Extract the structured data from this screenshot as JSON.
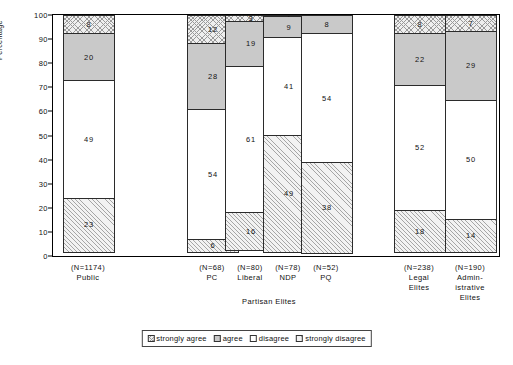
{
  "chart_data": {
    "type": "bar",
    "subtype": "stacked-bar-100",
    "title": "",
    "xlabel": "",
    "ylabel": "Percentage",
    "ylim": [
      0,
      100
    ],
    "yticks": [
      0,
      10,
      20,
      30,
      40,
      50,
      60,
      70,
      80,
      90,
      100
    ],
    "grid": false,
    "legend_position": "bottom",
    "series": [
      {
        "name": "strongly agree",
        "key": "sa",
        "values": [
          8,
          12,
          3,
          1,
          0,
          8,
          7
        ]
      },
      {
        "name": "agree",
        "key": "a",
        "values": [
          20,
          28,
          19,
          9,
          8,
          22,
          29
        ]
      },
      {
        "name": "disagree",
        "key": "d",
        "values": [
          49,
          54,
          61,
          41,
          54,
          52,
          50
        ]
      },
      {
        "name": "strongly disagree",
        "key": "sd",
        "values": [
          23,
          6,
          16,
          49,
          38,
          18,
          14
        ]
      }
    ],
    "categories": [
      "Public",
      "PC",
      "Liberal",
      "NDP",
      "PQ",
      "Legal Elites",
      "Administrative Elites"
    ],
    "sample_sizes": [
      "(N=1174)",
      "(N=68)",
      "(N=80)",
      "(N=78)",
      "(N=52)",
      "(N=238)",
      "(N=190)"
    ],
    "group_label": "Partisan Elites"
  },
  "axis": {
    "y_title": "Percentage",
    "y_ticks": [
      "0",
      "10",
      "20",
      "30",
      "40",
      "50",
      "60",
      "70",
      "80",
      "90",
      "100"
    ]
  },
  "bars": [
    {
      "name": "Public",
      "n_label": "(N=1174)",
      "category_lines": [
        "Public"
      ],
      "segments": [
        {
          "label": "strongly agree",
          "value": 8,
          "display": "8",
          "fill": "sa"
        },
        {
          "label": "agree",
          "value": 20,
          "display": "20",
          "fill": "a"
        },
        {
          "label": "disagree",
          "value": 49,
          "display": "49",
          "fill": "d"
        },
        {
          "label": "strongly disagree",
          "value": 23,
          "display": "23",
          "fill": "sd"
        }
      ]
    },
    {
      "name": "PC",
      "n_label": "(N=68)",
      "category_lines": [
        "PC"
      ],
      "segments": [
        {
          "label": "strongly agree",
          "value": 12,
          "display": "12",
          "fill": "sa"
        },
        {
          "label": "agree",
          "value": 28,
          "display": "28",
          "fill": "a"
        },
        {
          "label": "disagree",
          "value": 54,
          "display": "54",
          "fill": "d"
        },
        {
          "label": "strongly disagree",
          "value": 6,
          "display": "6",
          "fill": "sd"
        }
      ]
    },
    {
      "name": "Liberal",
      "n_label": "(N=80)",
      "category_lines": [
        "Liberal"
      ],
      "segments": [
        {
          "label": "strongly agree",
          "value": 3,
          "display": "3",
          "fill": "sa"
        },
        {
          "label": "agree",
          "value": 19,
          "display": "19",
          "fill": "a"
        },
        {
          "label": "disagree",
          "value": 61,
          "display": "61",
          "fill": "d"
        },
        {
          "label": "strongly disagree",
          "value": 16,
          "display": "16",
          "fill": "sd"
        }
      ]
    },
    {
      "name": "NDP",
      "n_label": "(N=78)",
      "category_lines": [
        "NDP"
      ],
      "segments": [
        {
          "label": "strongly agree",
          "value": 1,
          "display": "1",
          "fill": "sa"
        },
        {
          "label": "agree",
          "value": 9,
          "display": "9",
          "fill": "a"
        },
        {
          "label": "disagree",
          "value": 41,
          "display": "41",
          "fill": "d"
        },
        {
          "label": "strongly disagree",
          "value": 49,
          "display": "49",
          "fill": "sd"
        }
      ]
    },
    {
      "name": "PQ",
      "n_label": "(N=52)",
      "category_lines": [
        "PQ"
      ],
      "segments": [
        {
          "label": "strongly agree",
          "value": 0,
          "display": "",
          "fill": "sa"
        },
        {
          "label": "agree",
          "value": 8,
          "display": "8",
          "fill": "a"
        },
        {
          "label": "disagree",
          "value": 54,
          "display": "54",
          "fill": "d"
        },
        {
          "label": "strongly disagree",
          "value": 38,
          "display": "38",
          "fill": "sd"
        }
      ]
    },
    {
      "name": "Legal Elites",
      "n_label": "(N=238)",
      "category_lines": [
        "Legal",
        "Elites"
      ],
      "segments": [
        {
          "label": "strongly agree",
          "value": 8,
          "display": "8",
          "fill": "sa"
        },
        {
          "label": "agree",
          "value": 22,
          "display": "22",
          "fill": "a"
        },
        {
          "label": "disagree",
          "value": 52,
          "display": "52",
          "fill": "d"
        },
        {
          "label": "strongly disagree",
          "value": 18,
          "display": "18",
          "fill": "sd"
        }
      ]
    },
    {
      "name": "Administrative Elites",
      "n_label": "(N=190)",
      "category_lines": [
        "Admin-",
        "istrative",
        "Elites"
      ],
      "segments": [
        {
          "label": "strongly agree",
          "value": 7,
          "display": "7",
          "fill": "sa"
        },
        {
          "label": "agree",
          "value": 29,
          "display": "29",
          "fill": "a"
        },
        {
          "label": "disagree",
          "value": 50,
          "display": "50",
          "fill": "d"
        },
        {
          "label": "strongly disagree",
          "value": 14,
          "display": "14",
          "fill": "sd"
        }
      ]
    }
  ],
  "group_label": "Partisan Elites",
  "legend": {
    "items": [
      {
        "label": "strongly agree",
        "fill": "sa"
      },
      {
        "label": "agree",
        "fill": "a"
      },
      {
        "label": "disagree",
        "fill": "d"
      },
      {
        "label": "strongly disagree",
        "fill": "sd"
      }
    ]
  },
  "colors": {
    "agree_grey": "#c9c9c9",
    "hatch_grey": "#9a9a9a",
    "frame": "#000000",
    "background": "#ffffff"
  }
}
